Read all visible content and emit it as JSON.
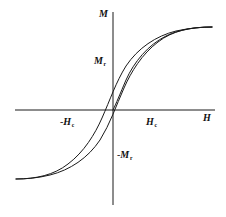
{
  "figure": {
    "name": "magnetic-hysteresis-loop",
    "background_color": "#ffffff",
    "stroke_color": "#1a1a1a"
  },
  "axes": {
    "vertical": {
      "label": "M",
      "label_full": "M",
      "meaning": "magnetization"
    },
    "horizontal": {
      "label": "H",
      "label_full": "H",
      "meaning": "applied magnetic field"
    },
    "origin": {
      "x": 113,
      "y": 110
    },
    "x_range_px": [
      15,
      215
    ],
    "y_range_px": [
      12,
      205
    ]
  },
  "labels": {
    "m_axis": "M",
    "remanence": {
      "symbol": "M",
      "subscript": "r"
    },
    "neg_remanence": {
      "minus": "-",
      "symbol": "M",
      "subscript": "r"
    },
    "coercivity": {
      "symbol": "H",
      "subscript": "c"
    },
    "neg_coercivity": {
      "minus": "-",
      "symbol": "H",
      "subscript": "c"
    },
    "h_axis": "H"
  },
  "chart_data": {
    "type": "line",
    "title": "",
    "xlabel": "H",
    "ylabel": "M",
    "grid": false,
    "legend": null,
    "annotations": [
      {
        "text": "M",
        "role": "y-axis-label",
        "px": [
          99,
          9
        ]
      },
      {
        "text": "M_r",
        "role": "remanence-marker",
        "px": [
          94,
          56
        ]
      },
      {
        "text": "-M_r",
        "role": "negative-remanence-marker",
        "px": [
          117,
          150
        ]
      },
      {
        "text": "H_c",
        "role": "coercivity-marker",
        "px": [
          146,
          117
        ]
      },
      {
        "text": "-H_c",
        "role": "negative-coercivity-marker",
        "px": [
          60,
          117
        ]
      },
      {
        "text": "H",
        "role": "x-axis-label",
        "px": [
          203,
          113
        ]
      }
    ],
    "series": [
      {
        "name": "initial magnetization curve",
        "path": "M 113 110 C 116 104 120 94 126 80 C 134 62 148 45 166 36 C 180 29 196 27 212 27"
      },
      {
        "name": "upper branch (descending from positive saturation)",
        "path": "M 212 27 C 190 27 172 31 158 42 C 142 54 131 72 124 88 C 116 106 110 124 100 140 C 88 158 70 170 50 175 C 38 178 26 179 16 179"
      },
      {
        "name": "lower branch (ascending from negative saturation)",
        "path": "M 16 179 C 36 179 54 175 68 164 C 84 152 95 134 102 118 C 110 100 116 82 126 66 C 138 48 156 36 176 31 C 190 28 202 27 212 27"
      }
    ],
    "key_points": {
      "positive_saturation_px": [
        212,
        27
      ],
      "negative_saturation_px": [
        16,
        179
      ],
      "remanence_px": [
        113,
        68
      ],
      "negative_remanence_px": [
        113,
        152
      ],
      "coercivity_px": [
        132,
        110
      ],
      "negative_coercivity_px": [
        94,
        110
      ]
    }
  }
}
